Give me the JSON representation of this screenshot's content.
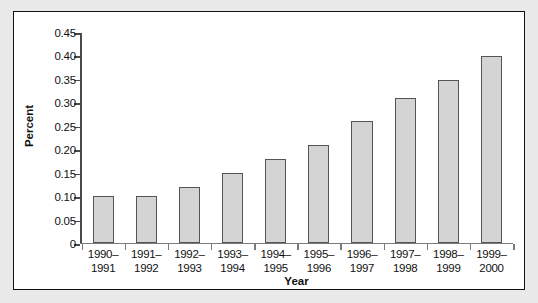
{
  "chart_data": {
    "type": "bar",
    "title": "",
    "subtitle": "",
    "xlabel": "Year",
    "ylabel": "Percent",
    "categories": [
      "1990–\n1991",
      "1991–\n1992",
      "1992–\n1993",
      "1993–\n1994",
      "1994–\n1995",
      "1995–\n1996",
      "1996–\n1997",
      "1997–\n1998",
      "1998–\n1999",
      "1999–\n2000"
    ],
    "category_lines": [
      [
        "1990–",
        "1991"
      ],
      [
        "1991–",
        "1992"
      ],
      [
        "1992–",
        "1993"
      ],
      [
        "1993–",
        "1994"
      ],
      [
        "1994–",
        "1995"
      ],
      [
        "1995–",
        "1996"
      ],
      [
        "1996–",
        "1997"
      ],
      [
        "1997–",
        "1998"
      ],
      [
        "1998–",
        "1999"
      ],
      [
        "1999–",
        "2000"
      ]
    ],
    "values": [
      0.1,
      0.1,
      0.12,
      0.15,
      0.18,
      0.21,
      0.26,
      0.31,
      0.35,
      0.4
    ],
    "ylim": [
      0,
      0.45
    ],
    "ytick_values": [
      0,
      0.05,
      0.1,
      0.15,
      0.2,
      0.25,
      0.3,
      0.35,
      0.4,
      0.45
    ],
    "ytick_labels": [
      "0",
      "0.05",
      "0.10",
      "0.15",
      "0.20",
      "0.25",
      "0.30",
      "0.35",
      "0.40",
      "0.45"
    ],
    "grid": false,
    "legend": null,
    "legend_position": "none",
    "bar_fill_color": "#d4d4d4",
    "bar_edge_color": "#555555",
    "axis_color": "#4a4a4a",
    "panel_background": "#ffffff",
    "page_background": "#e9e9e9",
    "panel_border_color": "#111111"
  }
}
